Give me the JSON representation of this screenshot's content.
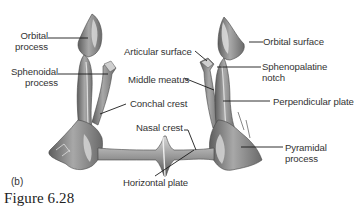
{
  "figure": {
    "title": "Figure 6.28",
    "panel": "(b)"
  },
  "labels": {
    "left": {
      "orbital_process_1": "Orbital",
      "orbital_process_2": "process",
      "sphenoidal_process_1": "Sphenoidal",
      "sphenoidal_process_2": "process"
    },
    "center": {
      "articular_surface": "Articular surface",
      "middle_meatus": "Middle meatus",
      "conchal_crest": "Conchal crest",
      "nasal_crest": "Nasal crest",
      "horizontal_plate": "Horizontal plate"
    },
    "right": {
      "orbital_surface": "Orbital surface",
      "sphenopalatine_notch_1": "Sphenopalatine",
      "sphenopalatine_notch_2": "notch",
      "perpendicular_plate": "Perpendicular plate",
      "pyramidal_process_1": "Pyramidal",
      "pyramidal_process_2": "process"
    }
  },
  "colors": {
    "bone_dark": "#6e6e6e",
    "bone_mid": "#9a9a9a",
    "bone_light": "#d8d8d8",
    "leader_line": "#1a1a1a",
    "text": "#333333"
  }
}
